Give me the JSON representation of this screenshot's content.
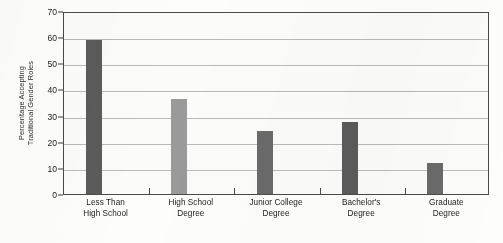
{
  "chart_data": {
    "type": "bar",
    "title": "",
    "xlabel": "",
    "ylabel": "Percentage Accepting Traditional Gender Roles",
    "ylabel_lines": [
      "Percentage Accepting",
      "Traditional Gender Roles"
    ],
    "categories": [
      "Less Than High School",
      "High School Degree",
      "Junior College Degree",
      "Bachelor's Degree",
      "Graduate Degree"
    ],
    "category_lines": [
      [
        "Less Than",
        "High School"
      ],
      [
        "High School",
        "Degree"
      ],
      [
        "Junior College",
        "Degree"
      ],
      [
        "Bachelor's",
        "Degree"
      ],
      [
        "Graduate",
        "Degree"
      ]
    ],
    "values": [
      59,
      36.5,
      24,
      27.5,
      12
    ],
    "bar_colors": [
      "#5b5b5b",
      "#9a9a9a",
      "#6a6a6a",
      "#5b5b5b",
      "#6a6a6a"
    ],
    "ylim": [
      0,
      70
    ],
    "yticks": [
      0,
      10,
      20,
      30,
      40,
      50,
      60,
      70
    ],
    "ytick_labels": [
      "0",
      "10",
      "20",
      "30",
      "40",
      "50",
      "60",
      "70"
    ],
    "grid": true,
    "grid_color": "#b9b9b9",
    "legend": "none",
    "axis_color": "#4a4a4a",
    "background": "#fbfbfa"
  }
}
